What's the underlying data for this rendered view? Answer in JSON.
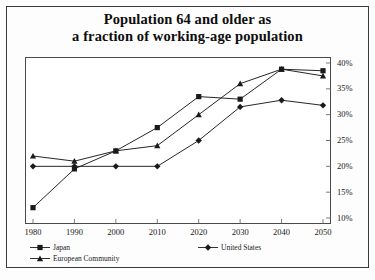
{
  "title": {
    "line1": "Population 64 and older as",
    "line2": "a fraction of working-age population"
  },
  "chart_data": {
    "type": "line",
    "title": "Population 64 and older as a fraction of working-age population",
    "xlabel": "",
    "ylabel": "",
    "x": [
      1980,
      1990,
      2000,
      2010,
      2020,
      2030,
      2040,
      2050
    ],
    "xtick_labels": [
      "1980",
      "1990",
      "2000",
      "2010",
      "2020",
      "2030",
      "2040",
      "2050"
    ],
    "ytick_labels": [
      "10%",
      "15%",
      "20%",
      "25%",
      "30%",
      "35%",
      "40%"
    ],
    "ytick_values": [
      10,
      15,
      20,
      25,
      30,
      35,
      40
    ],
    "ylim": [
      10,
      40
    ],
    "xlim": [
      1980,
      2050
    ],
    "grid": false,
    "y_axis_position": "right",
    "legend_position": "below",
    "series": [
      {
        "name": "Japan",
        "marker": "square",
        "values": [
          12.0,
          19.5,
          23.0,
          27.5,
          33.5,
          33.0,
          38.8,
          38.5
        ]
      },
      {
        "name": "United States",
        "marker": "diamond",
        "values": [
          20.0,
          20.0,
          20.0,
          20.0,
          25.0,
          31.5,
          32.8,
          31.8
        ]
      },
      {
        "name": "European Community",
        "marker": "triangle",
        "values": [
          22.0,
          21.0,
          23.0,
          24.0,
          30.0,
          36.0,
          38.8,
          37.5
        ]
      }
    ]
  },
  "legend": {
    "japan": "Japan",
    "united_states": "United States",
    "european_community": "European Community"
  },
  "colors": {
    "line": "#1a1a1a",
    "frame": "#4a4a4a",
    "text": "#0d0d0d"
  }
}
